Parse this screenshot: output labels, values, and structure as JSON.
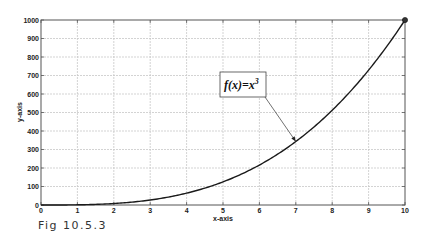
{
  "chart_data": {
    "type": "line",
    "title": "",
    "xlabel": "x-axis",
    "ylabel": "y-axis",
    "xlim": [
      0,
      10
    ],
    "ylim": [
      0,
      1000
    ],
    "xticks": [
      0,
      1,
      2,
      3,
      4,
      5,
      6,
      7,
      8,
      9,
      10
    ],
    "yticks": [
      0,
      100,
      200,
      300,
      400,
      500,
      600,
      700,
      800,
      900,
      1000
    ],
    "grid": true,
    "series": [
      {
        "name": "f(x)=x^3",
        "x": [
          0,
          1,
          2,
          3,
          4,
          5,
          6,
          7,
          8,
          9,
          10
        ],
        "values": [
          0,
          1,
          8,
          27,
          64,
          125,
          216,
          343,
          512,
          729,
          1000
        ]
      }
    ],
    "annotations": [
      {
        "text": "f(x)=x",
        "superscript": "3",
        "arrow_to": [
          7,
          343
        ]
      }
    ],
    "markers": [
      {
        "x": 10,
        "y": 1000,
        "shape": "circle"
      }
    ]
  },
  "caption": "Fig 10.5.3",
  "colors": {
    "line": "#1a1a1a",
    "grid": "#c8c8c8",
    "axis": "#555555"
  }
}
